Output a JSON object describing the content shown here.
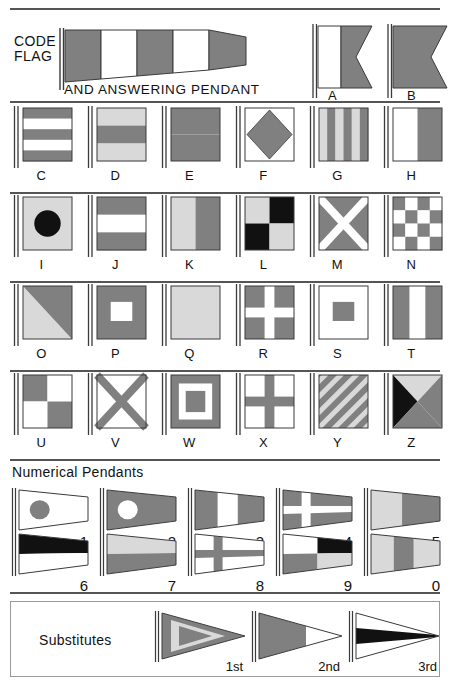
{
  "colors": {
    "gray": "#808080",
    "light": "#d9d9d9",
    "white": "#ffffff",
    "black": "#111111",
    "outline": "#3a3a3a",
    "rule": "#555555",
    "box_border": "#9a9a9a"
  },
  "header": {
    "code_flag_line1": "CODE",
    "code_flag_line2": "FLAG",
    "answering_pendant": "AND ANSWERING PENDANT",
    "code_pendant": {
      "name": "code-flag-answering-pendant",
      "type": "pendant",
      "bands": [
        "gray",
        "white",
        "gray",
        "white",
        "gray"
      ]
    },
    "swallowtails": [
      {
        "letter": "A",
        "pattern": "vertical-half",
        "colors": [
          "white",
          "gray"
        ]
      },
      {
        "letter": "B",
        "pattern": "solid",
        "colors": [
          "gray"
        ]
      }
    ]
  },
  "alphabet_rows": [
    {
      "row": 1,
      "flags": [
        {
          "letter": "C",
          "pattern": "horizontal-stripes-5",
          "colors": [
            "gray",
            "white",
            "gray",
            "white",
            "gray"
          ]
        },
        {
          "letter": "D",
          "pattern": "horizontal-stripes-3",
          "colors": [
            "light",
            "gray",
            "light"
          ]
        },
        {
          "letter": "E",
          "pattern": "horizontal-half",
          "colors": [
            "gray",
            "gray"
          ]
        },
        {
          "letter": "F",
          "pattern": "diamond",
          "colors": [
            "white",
            "gray"
          ]
        },
        {
          "letter": "G",
          "pattern": "vertical-stripes-6",
          "colors": [
            "light",
            "gray",
            "light",
            "gray",
            "light",
            "gray"
          ]
        },
        {
          "letter": "H",
          "pattern": "vertical-half",
          "colors": [
            "white",
            "gray"
          ]
        }
      ]
    },
    {
      "row": 2,
      "flags": [
        {
          "letter": "I",
          "pattern": "circle",
          "colors": [
            "light",
            "black"
          ]
        },
        {
          "letter": "J",
          "pattern": "horizontal-stripes-3",
          "colors": [
            "gray",
            "white",
            "gray"
          ]
        },
        {
          "letter": "K",
          "pattern": "vertical-half",
          "colors": [
            "light",
            "gray"
          ]
        },
        {
          "letter": "L",
          "pattern": "quartered",
          "colors": [
            "light",
            "black",
            "black",
            "light"
          ]
        },
        {
          "letter": "M",
          "pattern": "saltire",
          "colors": [
            "gray",
            "white"
          ]
        },
        {
          "letter": "N",
          "pattern": "checker-4",
          "colors": [
            "gray",
            "white"
          ]
        }
      ]
    },
    {
      "row": 3,
      "flags": [
        {
          "letter": "O",
          "pattern": "diagonal-half",
          "colors": [
            "light",
            "gray"
          ]
        },
        {
          "letter": "P",
          "pattern": "center-rect",
          "colors": [
            "gray",
            "white"
          ]
        },
        {
          "letter": "Q",
          "pattern": "solid",
          "colors": [
            "light"
          ]
        },
        {
          "letter": "R",
          "pattern": "cross",
          "colors": [
            "gray",
            "white"
          ]
        },
        {
          "letter": "S",
          "pattern": "center-rect",
          "colors": [
            "white",
            "gray"
          ]
        },
        {
          "letter": "T",
          "pattern": "vertical-stripes-3",
          "colors": [
            "gray",
            "white",
            "gray"
          ]
        }
      ]
    },
    {
      "row": 4,
      "flags": [
        {
          "letter": "U",
          "pattern": "quartered",
          "colors": [
            "gray",
            "white",
            "white",
            "gray"
          ]
        },
        {
          "letter": "V",
          "pattern": "saltire",
          "colors": [
            "white",
            "gray"
          ]
        },
        {
          "letter": "W",
          "pattern": "concentric",
          "colors": [
            "gray",
            "white",
            "gray"
          ]
        },
        {
          "letter": "X",
          "pattern": "cross",
          "colors": [
            "white",
            "gray"
          ]
        },
        {
          "letter": "Y",
          "pattern": "diagonal-stripes",
          "colors": [
            "gray",
            "light"
          ]
        },
        {
          "letter": "Z",
          "pattern": "quarter-triangles",
          "colors": [
            "light",
            "black",
            "gray",
            "gray"
          ]
        }
      ]
    }
  ],
  "numerical": {
    "title": "Numerical Pendants",
    "row1": [
      {
        "num": "1",
        "pattern": "circle",
        "colors": [
          "white",
          "gray"
        ]
      },
      {
        "num": "2",
        "pattern": "circle",
        "colors": [
          "gray",
          "white"
        ]
      },
      {
        "num": "3",
        "pattern": "vertical-stripes-3",
        "colors": [
          "gray",
          "white",
          "gray"
        ]
      },
      {
        "num": "4",
        "pattern": "cross",
        "colors": [
          "gray",
          "white"
        ]
      },
      {
        "num": "5",
        "pattern": "vertical-half",
        "colors": [
          "light",
          "gray"
        ]
      }
    ],
    "row2": [
      {
        "num": "6",
        "pattern": "horizontal-half",
        "colors": [
          "black",
          "white"
        ]
      },
      {
        "num": "7",
        "pattern": "horizontal-half",
        "colors": [
          "light",
          "gray"
        ]
      },
      {
        "num": "8",
        "pattern": "cross",
        "colors": [
          "white",
          "gray"
        ]
      },
      {
        "num": "9",
        "pattern": "quartered",
        "colors": [
          "white",
          "black",
          "gray",
          "light"
        ]
      },
      {
        "num": "0",
        "pattern": "vertical-stripes-3",
        "colors": [
          "light",
          "gray",
          "light"
        ]
      }
    ]
  },
  "substitutes": {
    "title": "Substitutes",
    "items": [
      {
        "label": "1st",
        "pattern": "chevron",
        "colors": [
          "gray",
          "light"
        ]
      },
      {
        "label": "2nd",
        "pattern": "hoist-block",
        "colors": [
          "gray",
          "white"
        ]
      },
      {
        "label": "3rd",
        "pattern": "center-band",
        "colors": [
          "white",
          "black"
        ]
      }
    ]
  }
}
